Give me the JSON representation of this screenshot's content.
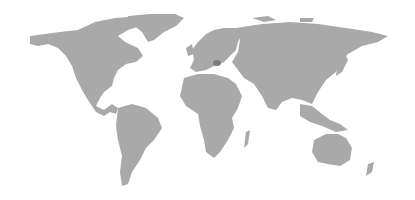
{
  "map": {
    "type": "world-map",
    "land_color": "#a9a9a9",
    "highlight_color": "#7c7c7c",
    "background": "#ffffff",
    "highlighted_region": "Romania"
  }
}
